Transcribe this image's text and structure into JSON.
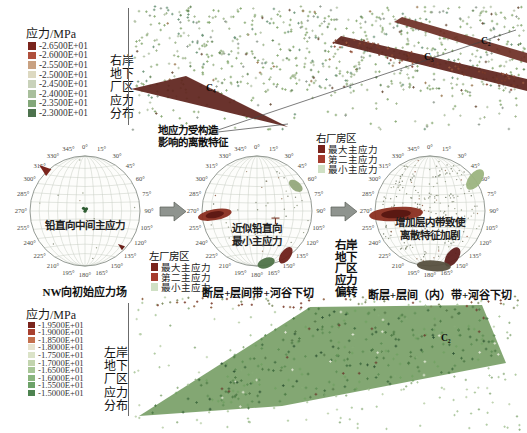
{
  "chart_data": [
    {
      "id": "right-bank-underground-stress-scatter",
      "type": "scatter",
      "title_side_lines": [
        "右岸",
        "地下",
        "厂区",
        "应力",
        "分布"
      ],
      "colorbar": {
        "title": "应力/MPa",
        "tick_values": [
          "-2.6500E+01",
          "-2.6000E+01",
          "-2.5500E+01",
          "-2.5000E+01",
          "-2.4500E+01",
          "-2.4000E+01",
          "-2.3500E+01",
          "-2.3000E+01"
        ],
        "colors": [
          "#7a241c",
          "#b0503c",
          "#c9a181",
          "#ddd9c1",
          "#c9d2ba",
          "#a9bf9c",
          "#83a779",
          "#4d724d"
        ]
      },
      "annotation_lines": [
        "地应力受构造",
        "影响的离散特征"
      ],
      "zone_labels": [
        {
          "text": "C₄",
          "x": 206,
          "y": 83
        },
        {
          "text": "C₃",
          "x": 424,
          "y": 52
        },
        {
          "text": "C₂",
          "x": 481,
          "y": 36
        }
      ],
      "zones": [
        {
          "polygon": [
            [
              131,
              89
            ],
            [
              186,
              76
            ],
            [
              288,
              127
            ]
          ],
          "color": "#5f231d"
        },
        {
          "polygon": [
            [
              333,
              43
            ],
            [
              341,
              36
            ],
            [
              527,
              79
            ],
            [
              527,
              91
            ]
          ],
          "color": "#5f231d"
        },
        {
          "polygon": [
            [
              394,
              22
            ],
            [
              402,
              17
            ],
            [
              527,
              53
            ],
            [
              527,
              63
            ]
          ],
          "color": "#6e2f26"
        }
      ],
      "pointer_origin": [
        209,
        133
      ],
      "pointer_targets": [
        [
          288,
          124
        ],
        [
          516,
          30
        ]
      ],
      "field": {
        "x": 132,
        "y": 6,
        "w": 393,
        "h": 124,
        "count": 1000,
        "sparse_below_y": 92,
        "seed": 42
      }
    },
    {
      "id": "stereonet-initial-field",
      "type": "stereonet",
      "cx": 85,
      "cy": 211,
      "r": 55,
      "tick_interval_deg": 15,
      "inner_lines": [
        "铅直向中间主应力"
      ],
      "caption": "NW向初始应力场",
      "speckles": 12,
      "seed": 7,
      "clusters": [
        {
          "name": "max-principal-nw",
          "azimuth_deg": 315,
          "radial_frac": 1.0,
          "shape": "wedge",
          "size": 7,
          "color": "#7a241c"
        },
        {
          "name": "intermediate-principal-vertical",
          "azimuth_deg": 0,
          "radial_frac": 0.03,
          "shape": "dots",
          "size": 1.6,
          "color": "#2f5d33"
        },
        {
          "name": "min-principal-se",
          "azimuth_deg": 135,
          "radial_frac": 0.95,
          "shape": "wedge",
          "size": 4,
          "color": "#6b2019"
        }
      ]
    },
    {
      "id": "stereonet-fault-interlayer-valley",
      "type": "stereonet",
      "cx": 257,
      "cy": 211,
      "r": 55,
      "tick_interval_deg": 15,
      "inner_lines": [
        "近似铅直向",
        "最小主应力"
      ],
      "caption": "断层+层间带+河谷下切",
      "speckles": 45,
      "seed": 11,
      "clusters": [
        {
          "name": "max-principal-band",
          "azimuth_deg": 265,
          "radial_frac": 0.77,
          "shape": "ellipse",
          "rx": 17,
          "ry": 5.5,
          "rot": -10,
          "color": "#8a2e20",
          "core": "#5f1a14"
        },
        {
          "name": "second-principal-ne",
          "azimuth_deg": 57,
          "radial_frac": 0.84,
          "shape": "ellipse",
          "rx": 8,
          "ry": 4.5,
          "rot": 38,
          "color": "#95a87c"
        },
        {
          "name": "min-principal-se",
          "azimuth_deg": 147,
          "radial_frac": 0.96,
          "shape": "ellipse",
          "rx": 5,
          "ry": 9.5,
          "rot": 35,
          "color": "#6e2019"
        },
        {
          "name": "min-principal-s",
          "azimuth_deg": 170,
          "radial_frac": 0.96,
          "shape": "ellipse",
          "rx": 9,
          "ry": 5,
          "rot": -20,
          "color": "#4f7348"
        },
        {
          "name": "vertical-marker",
          "azimuth_deg": 111,
          "radial_frac": 0.36,
          "shape": "tmark",
          "size": 8,
          "color": "#7a3a2a"
        }
      ]
    },
    {
      "id": "stereonet-fault-interlayer-inner-valley",
      "type": "stereonet",
      "cx": 430,
      "cy": 211,
      "r": 55,
      "tick_interval_deg": 15,
      "inner_lines": [
        "增加层内带致使",
        "离散特征加剧"
      ],
      "caption": "断层+层间（内）带+河谷下切",
      "speckles": 220,
      "seed": 23,
      "clusters": [
        {
          "name": "max-principal-band",
          "azimuth_deg": 265,
          "radial_frac": 0.62,
          "shape": "ellipse",
          "rx": 27,
          "ry": 7,
          "rot": -4,
          "color": "#8a2e20",
          "core": "#5a1812"
        },
        {
          "name": "second-principal-ne",
          "azimuth_deg": 55,
          "radial_frac": 1.0,
          "shape": "ellipse",
          "rx": 6.5,
          "ry": 12,
          "rot": 38,
          "color": "#9cb480"
        },
        {
          "name": "min-principal-se",
          "azimuth_deg": 154,
          "radial_frac": 0.93,
          "shape": "ellipse",
          "rx": 6,
          "ry": 11,
          "rot": 35,
          "color": "#5f1f1c"
        },
        {
          "name": "min-principal-s",
          "azimuth_deg": 176,
          "radial_frac": 1.0,
          "shape": "ellipse",
          "rx": 17,
          "ry": 5.5,
          "rot": 4,
          "color": "#57503f"
        }
      ]
    },
    {
      "id": "left-bank-underground-stress-scatter",
      "type": "scatter",
      "title_side_lines": [
        "左岸",
        "地下",
        "厂区",
        "应力",
        "分布"
      ],
      "colorbar": {
        "title": "应力/MPa",
        "tick_values": [
          "-1.9500E+01",
          "-1.9000E+01",
          "-1.8500E+01",
          "-1.8000E+01",
          "-1.7500E+01",
          "-1.7000E+01",
          "-1.6500E+01",
          "-1.6000E+01",
          "-1.5500E+01",
          "-1.5000E+01"
        ],
        "colors": [
          "#7a241c",
          "#a8402f",
          "#c4704d",
          "#e8e4cf",
          "#dbe3c8",
          "#c2d4ae",
          "#a8c697",
          "#8bb57e",
          "#6da268",
          "#4e8350"
        ]
      },
      "zone_labels": [
        {
          "text": "C₂",
          "x": 441,
          "y": 333
        }
      ],
      "plane_polygon": [
        [
          139,
          416
        ],
        [
          310,
          307
        ],
        [
          482,
          305
        ],
        [
          506,
          363
        ],
        [
          282,
          406
        ]
      ],
      "plane_color": "#7ca26c",
      "field": {
        "x": 134,
        "y": 296,
        "w": 386,
        "h": 134,
        "count": 760,
        "seed": 99
      }
    }
  ],
  "legends": {
    "right_plant": {
      "title": "右厂房区",
      "entries": [
        {
          "label": "最大主应力",
          "color": "#7a241c"
        },
        {
          "label": "第二主应力",
          "color": "#a63c2e"
        },
        {
          "label": "最小主应力",
          "color": "#cfe0c4"
        }
      ]
    },
    "left_plant": {
      "title": "左厂房区",
      "entries": [
        {
          "label": "最大主应力",
          "color": "#7a241c"
        },
        {
          "label": "第二主应力",
          "color": "#a63c2e"
        },
        {
          "label": "最小主应力",
          "color": "#cfe0c4"
        }
      ]
    }
  },
  "flow": {
    "deflection_lines": [
      "右岸",
      "地下",
      "厂区",
      "应力",
      "偏转"
    ]
  }
}
